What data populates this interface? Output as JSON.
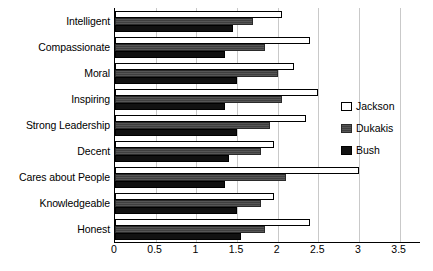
{
  "chart_data": {
    "type": "bar",
    "orientation": "horizontal",
    "title": "",
    "xlabel": "",
    "ylabel": "",
    "xlim": [
      0,
      3.75
    ],
    "xticks": [
      0,
      0.5,
      1,
      1.5,
      2,
      2.5,
      3,
      3.5
    ],
    "xticklabels": [
      "0",
      "0.5",
      "1",
      "1.5",
      "2",
      "2.5",
      "3",
      "3.5"
    ],
    "grid": true,
    "grid_axis": "x",
    "legend_position": "right",
    "categories": [
      "Intelligent",
      "Compassionate",
      "Moral",
      "Inspiring",
      "Strong Leadership",
      "Decent",
      "Cares about People",
      "Knowledgeable",
      "Honest"
    ],
    "series": [
      {
        "name": "Jackson",
        "color": "#ffffff",
        "values": [
          2.05,
          2.4,
          2.2,
          2.5,
          2.35,
          1.95,
          3.0,
          1.95,
          2.4
        ]
      },
      {
        "name": "Dukakis",
        "color": "#4a4a4a",
        "values": [
          1.7,
          1.85,
          2.0,
          2.05,
          1.9,
          1.8,
          2.1,
          1.8,
          1.85
        ]
      },
      {
        "name": "Bush",
        "color": "#111111",
        "values": [
          1.45,
          1.35,
          1.5,
          1.35,
          1.5,
          1.4,
          1.35,
          1.5,
          1.55
        ]
      }
    ]
  },
  "legend": {
    "items": [
      {
        "label": "Jackson",
        "key": "jackson"
      },
      {
        "label": "Dukakis",
        "key": "dukakis"
      },
      {
        "label": "Bush",
        "key": "bush"
      }
    ]
  },
  "caption": ""
}
